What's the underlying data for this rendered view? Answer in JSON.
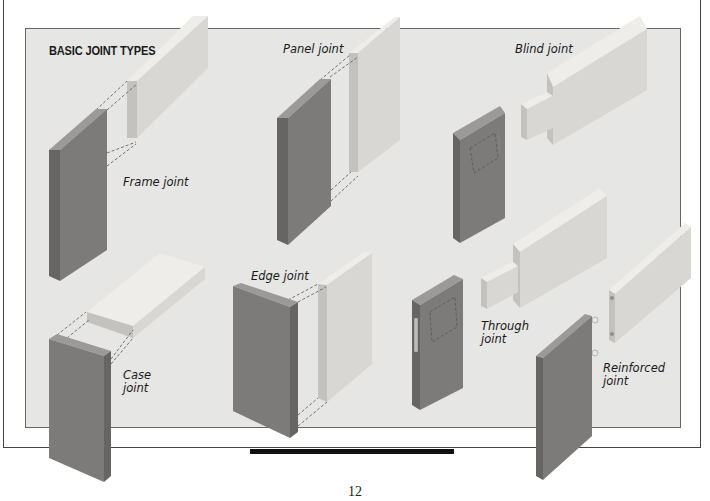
{
  "figure": {
    "title": "BASIC JOINT TYPES",
    "colors": {
      "panel_bg": "#e6e6e4",
      "dark_wood": "#7d7b79",
      "dark_wood_side": "#6a6867",
      "dark_wood_top": "#9a9896",
      "light_wood": "#d6d5d2",
      "light_wood_side": "#c2c1be",
      "light_wood_top": "#ecebe8"
    },
    "joints": [
      {
        "id": "frame",
        "label": "Frame joint"
      },
      {
        "id": "panel",
        "label": "Panel joint"
      },
      {
        "id": "blind",
        "label": "Blind joint"
      },
      {
        "id": "case",
        "label_line1": "Case",
        "label_line2": "joint"
      },
      {
        "id": "edge",
        "label": "Edge joint"
      },
      {
        "id": "through",
        "label_line1": "Through",
        "label_line2": "joint"
      },
      {
        "id": "reinforced",
        "label_line1": "Reinforced",
        "label_line2": "joint"
      }
    ]
  },
  "page": {
    "number": "12"
  }
}
